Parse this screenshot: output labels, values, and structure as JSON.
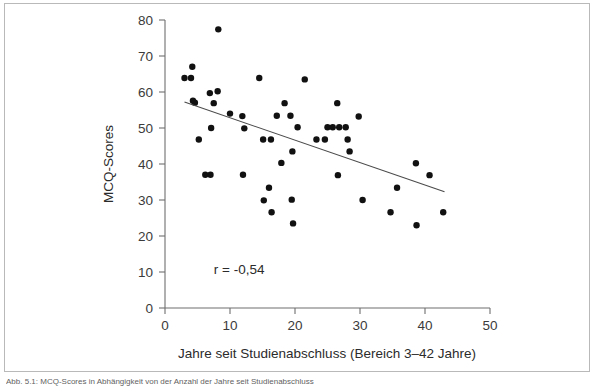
{
  "figure": {
    "caption_strip": "Abb. 5.1: MCQ-Scores in Abhängigkeit von der Anzahl der Jahre seit Studienabschluss"
  },
  "chart_data": {
    "type": "scatter",
    "title": "",
    "xlabel": "Jahre seit Studienabschluss (Bereich 3–42 Jahre)",
    "ylabel": "MCQ-Scores",
    "xlim": [
      0,
      50
    ],
    "ylim": [
      0,
      80
    ],
    "xticks": [
      0,
      10,
      20,
      30,
      40,
      50
    ],
    "yticks": [
      0,
      10,
      20,
      30,
      40,
      50,
      60,
      70,
      80
    ],
    "xtick_labels": [
      "0",
      "10",
      "20",
      "30",
      "40",
      "50"
    ],
    "ytick_labels": [
      "0",
      "10",
      "20",
      "30",
      "40",
      "50",
      "60",
      "70",
      "80"
    ],
    "grid": false,
    "legend": null,
    "annotations": [
      {
        "text": "r = -0,54",
        "x": 7.5,
        "y": 9.5
      }
    ],
    "marker": {
      "shape": "circle",
      "size": 5.2,
      "color": "#111111"
    },
    "trendline": {
      "type": "linear",
      "color": "#4a4a4a",
      "x_start": 3.0,
      "y_start": 57.2,
      "x_end": 43.0,
      "y_end": 32.3,
      "r": -0.54
    },
    "series": [
      {
        "name": "Teilnehmer",
        "points": [
          [
            3.0,
            63.9
          ],
          [
            4.0,
            63.9
          ],
          [
            4.2,
            67.0
          ],
          [
            4.3,
            57.6
          ],
          [
            4.6,
            57.0
          ],
          [
            5.2,
            46.8
          ],
          [
            6.2,
            37.0
          ],
          [
            6.9,
            59.7
          ],
          [
            7.0,
            37.0
          ],
          [
            7.1,
            50.0
          ],
          [
            7.5,
            56.9
          ],
          [
            8.1,
            60.2
          ],
          [
            8.2,
            77.4
          ],
          [
            10.0,
            54.0
          ],
          [
            11.9,
            53.3
          ],
          [
            12.0,
            37.0
          ],
          [
            12.2,
            49.9
          ],
          [
            14.5,
            63.9
          ],
          [
            15.1,
            46.8
          ],
          [
            15.2,
            29.9
          ],
          [
            16.0,
            33.4
          ],
          [
            16.3,
            46.8
          ],
          [
            16.4,
            26.6
          ],
          [
            17.2,
            53.4
          ],
          [
            17.9,
            40.3
          ],
          [
            18.4,
            56.9
          ],
          [
            19.3,
            53.4
          ],
          [
            19.5,
            30.1
          ],
          [
            19.6,
            43.5
          ],
          [
            19.7,
            23.5
          ],
          [
            20.4,
            50.2
          ],
          [
            21.5,
            63.5
          ],
          [
            23.3,
            46.8
          ],
          [
            24.6,
            46.8
          ],
          [
            25.0,
            50.2
          ],
          [
            25.8,
            50.2
          ],
          [
            26.5,
            56.9
          ],
          [
            26.6,
            36.9
          ],
          [
            26.8,
            50.2
          ],
          [
            27.8,
            50.2
          ],
          [
            28.1,
            46.8
          ],
          [
            28.4,
            43.5
          ],
          [
            29.8,
            53.2
          ],
          [
            30.4,
            30.0
          ],
          [
            34.7,
            26.6
          ],
          [
            35.7,
            33.4
          ],
          [
            38.6,
            40.2
          ],
          [
            38.7,
            23.0
          ],
          [
            40.7,
            36.9
          ],
          [
            42.8,
            26.6
          ]
        ]
      }
    ]
  }
}
